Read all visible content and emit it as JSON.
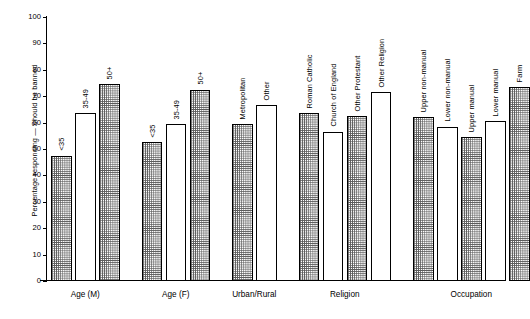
{
  "chart_data": {
    "type": "bar",
    "title": "",
    "xlabel": "",
    "ylabel": "Percentage responding — Should be banned",
    "ylim": [
      0,
      100
    ],
    "ytick_step": 10,
    "yticks": [
      0,
      10,
      20,
      30,
      40,
      50,
      60,
      70,
      80,
      90,
      100
    ],
    "grid": false,
    "legend": "none",
    "groups": [
      {
        "name": "Age (M)",
        "bars": [
          {
            "label": "<35",
            "value": 47.5,
            "fill": "hatched"
          },
          {
            "label": "35-49",
            "value": 63.5,
            "fill": "open"
          },
          {
            "label": "50+",
            "value": 74.5,
            "fill": "hatched"
          }
        ]
      },
      {
        "name": "Age (F)",
        "bars": [
          {
            "label": "<35",
            "value": 52.5,
            "fill": "hatched"
          },
          {
            "label": "35-49",
            "value": 59.5,
            "fill": "open"
          },
          {
            "label": "50+",
            "value": 72.5,
            "fill": "hatched"
          }
        ]
      },
      {
        "name": "Urban/Rural",
        "bars": [
          {
            "label": "Metropolitan",
            "value": 59.5,
            "fill": "hatched"
          },
          {
            "label": "Other",
            "value": 66.5,
            "fill": "open"
          }
        ]
      },
      {
        "name": "Religion",
        "bars": [
          {
            "label": "Roman Catholic",
            "value": 63.5,
            "fill": "hatched"
          },
          {
            "label": "Church of England",
            "value": 56.5,
            "fill": "open"
          },
          {
            "label": "Other Protestant",
            "value": 62.5,
            "fill": "hatched"
          },
          {
            "label": "Other Religion",
            "value": 71.5,
            "fill": "open"
          }
        ]
      },
      {
        "name": "Occupation",
        "bars": [
          {
            "label": "Upper non-manual",
            "value": 62.0,
            "fill": "hatched"
          },
          {
            "label": "Lower non-manual",
            "value": 58.5,
            "fill": "open"
          },
          {
            "label": "Upper manual",
            "value": 54.5,
            "fill": "hatched"
          },
          {
            "label": "Lower manual",
            "value": 60.5,
            "fill": "open"
          },
          {
            "label": "Farm",
            "value": 73.5,
            "fill": "hatched"
          }
        ]
      }
    ]
  },
  "colors": {
    "axis": "#000000",
    "bar_outline": "#000000",
    "bar_fill_hatch": "#5a5a5a",
    "bar_fill_open": "#ffffff",
    "background": "#ffffff"
  }
}
